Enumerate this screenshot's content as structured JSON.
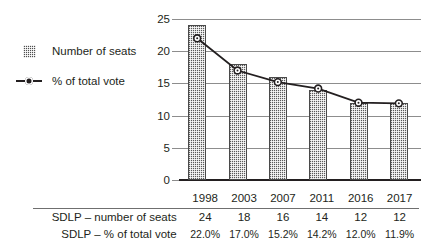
{
  "legend": {
    "items": [
      {
        "label": "Number of seats",
        "key": "bar-swatch"
      },
      {
        "label": "% of total vote",
        "key": "line-marker"
      }
    ]
  },
  "chart_data": {
    "type": "bar",
    "title": "",
    "subtitle": "",
    "xlabel": "",
    "ylabel": "",
    "categories": [
      "1998",
      "2003",
      "2007",
      "2011",
      "2016",
      "2017"
    ],
    "ylim": [
      0,
      25
    ],
    "yticks": [
      "0",
      "5",
      "10",
      "15",
      "20",
      "25"
    ],
    "grid": true,
    "legend_position": "left",
    "series": [
      {
        "name": "Number of seats",
        "type": "bar",
        "values": [
          24,
          18,
          16,
          14,
          12,
          12
        ]
      },
      {
        "name": "% of total vote",
        "type": "line",
        "values": [
          22.0,
          17.0,
          15.2,
          14.2,
          12.0,
          11.9
        ],
        "value_labels": [
          "22.0%",
          "17.0%",
          "15.2%",
          "14.2%",
          "12.0%",
          "11.9%"
        ]
      }
    ]
  },
  "table": {
    "columns": [
      "1998",
      "2003",
      "2007",
      "2011",
      "2016",
      "2017"
    ],
    "rows": [
      {
        "label": "SDLP – number of seats",
        "values": [
          "24",
          "18",
          "16",
          "14",
          "12",
          "12"
        ]
      },
      {
        "label": "SDLP – % of total vote",
        "values": [
          "22.0%",
          "17.0%",
          "15.2%",
          "14.2%",
          "12.0%",
          "11.9%"
        ]
      }
    ]
  },
  "colors": {
    "ink": "#231f20",
    "gridline": "#8d8d8d",
    "bar_fill": "#5a5a5a",
    "axis": "#231f20"
  }
}
